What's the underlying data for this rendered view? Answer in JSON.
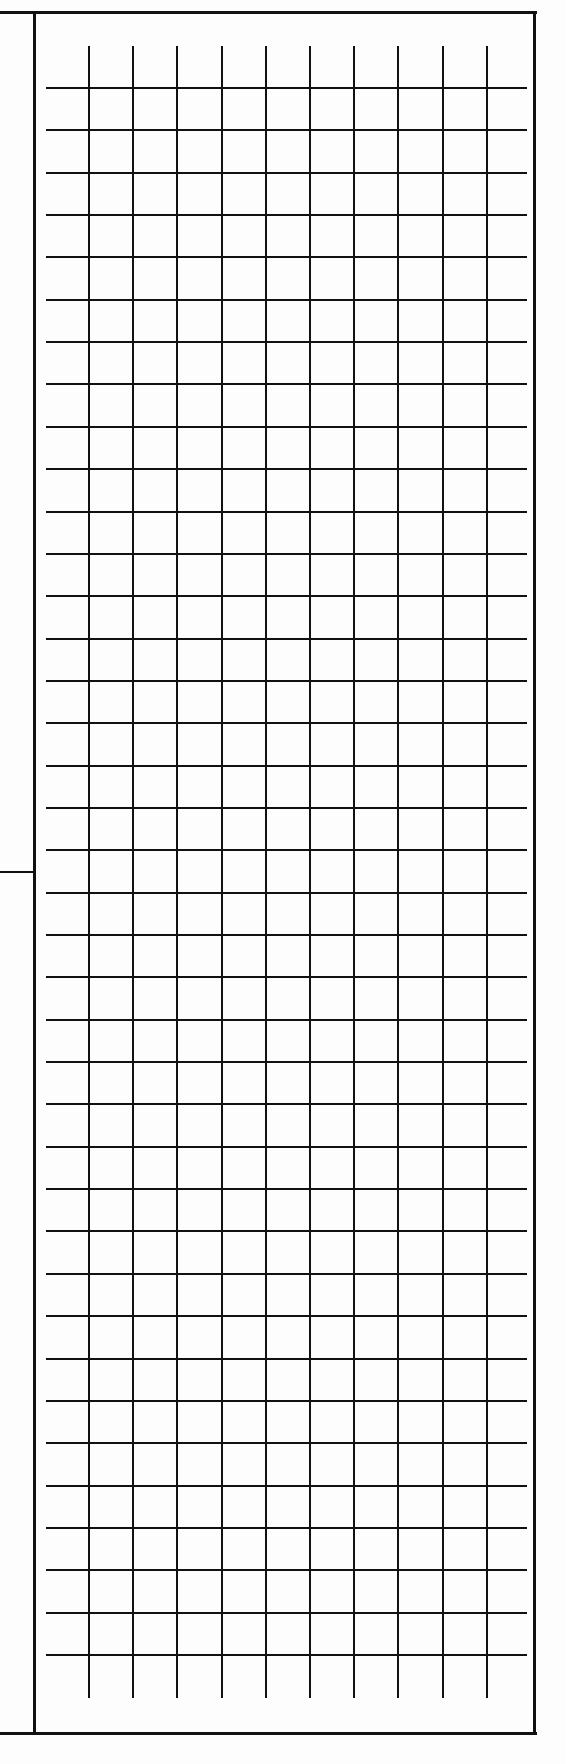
{
  "document": {
    "type": "blank graph paper sheet",
    "page_size_px": [
      566,
      1764
    ],
    "ink_color": "#111111",
    "paper_color": "#fdfdfd"
  },
  "frame": {
    "top_y": 12,
    "bottom_y": 1733,
    "left_x": 34,
    "right_x": 535,
    "left_margin_tick_y": 872
  },
  "grid": {
    "vertical_lines": {
      "count": 10,
      "x_start": 89,
      "spacing": 44.2,
      "y_from": 46,
      "y_to": 1698
    },
    "horizontal_lines": {
      "count": 38,
      "y_start": 88,
      "spacing": 42.35,
      "x_from": 46,
      "x_to": 527
    },
    "line_width": 2
  }
}
